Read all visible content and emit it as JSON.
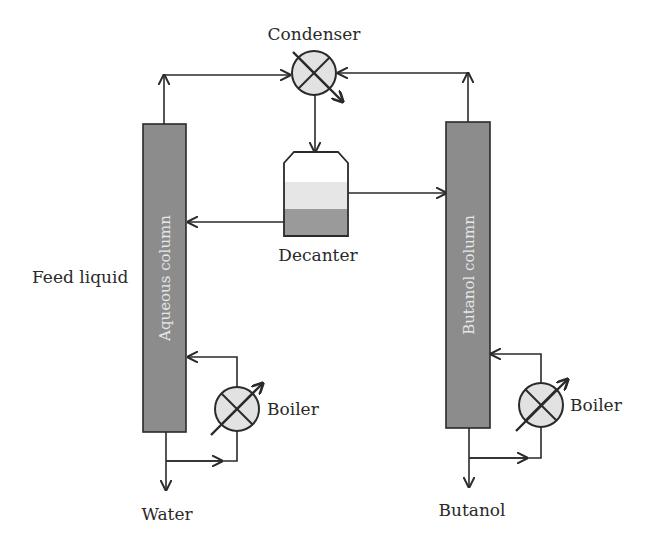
{
  "diagram": {
    "labels": {
      "condenser": "Condenser",
      "decanter": "Decanter",
      "feed_liquid": "Feed liquid",
      "aqueous_column": "Aqueous column",
      "butanol_column": "Butanol column",
      "boiler_left": "Boiler",
      "boiler_right": "Boiler",
      "water": "Water",
      "butanol": "Butanol"
    },
    "colors": {
      "column_fill": "#8c8c8c",
      "exchanger_fill": "#e2e2e2",
      "decanter_light_phase": "#e6e6e6",
      "decanter_heavy_phase": "#9a9a9a",
      "line": "#2a2a2a"
    },
    "nodes": [
      {
        "id": "condenser",
        "type": "heat-exchanger"
      },
      {
        "id": "decanter",
        "type": "vessel"
      },
      {
        "id": "aqueous_column",
        "type": "distillation-column"
      },
      {
        "id": "butanol_column",
        "type": "distillation-column"
      },
      {
        "id": "boiler_left",
        "type": "heat-exchanger"
      },
      {
        "id": "boiler_right",
        "type": "heat-exchanger"
      }
    ],
    "edges": [
      {
        "from": "aqueous_column",
        "to": "condenser"
      },
      {
        "from": "butanol_column",
        "to": "condenser"
      },
      {
        "from": "condenser",
        "to": "decanter"
      },
      {
        "from": "decanter",
        "to": "aqueous_column",
        "phase": "heavy"
      },
      {
        "from": "decanter",
        "to": "butanol_column",
        "phase": "light"
      },
      {
        "from": "aqueous_column",
        "to": "boiler_left"
      },
      {
        "from": "boiler_left",
        "to": "aqueous_column"
      },
      {
        "from": "butanol_column",
        "to": "boiler_right"
      },
      {
        "from": "boiler_right",
        "to": "butanol_column"
      },
      {
        "from": "aqueous_column",
        "to": "water"
      },
      {
        "from": "butanol_column",
        "to": "butanol"
      }
    ]
  }
}
